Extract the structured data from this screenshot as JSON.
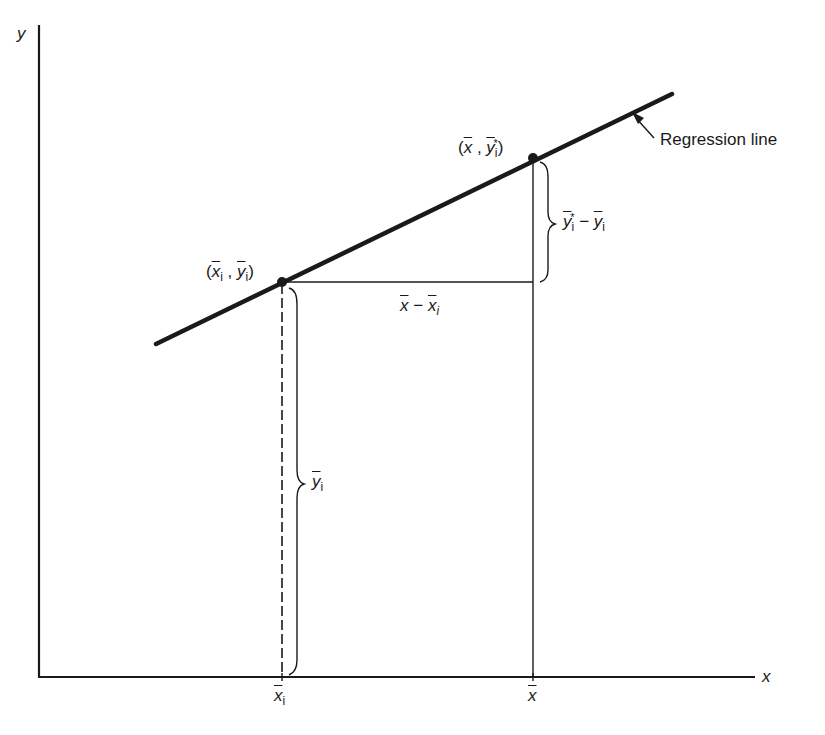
{
  "diagram": {
    "title": "",
    "axes": {
      "x_label": "x",
      "y_label": "y"
    },
    "regression_line_label": "Regression line",
    "points": [
      {
        "id": "point-i",
        "label_open": "(",
        "x_sym": "x",
        "x_sub": "i",
        "sep": " , ",
        "y_sym": "y",
        "y_sub": "i",
        "label_close": ")"
      },
      {
        "id": "point-mean",
        "label_open": "(",
        "x_sym": "x",
        "sep": " , ",
        "y_sym": "y",
        "y_sup": "*",
        "y_sub": "i",
        "label_close": ")"
      }
    ],
    "annotations": {
      "vertical_diff": {
        "a_sym": "y",
        "a_sup": "*",
        "a_sub": "i",
        "minus": " − ",
        "b_sym": "y",
        "b_sub": "i"
      },
      "horizontal_diff": {
        "a_sym": "x",
        "minus": " − ",
        "b_sym": "x",
        "b_sub": "i"
      },
      "height_brace": {
        "sym": "y",
        "sub": "i"
      }
    },
    "x_ticks": [
      {
        "sym": "x",
        "sub": "i"
      },
      {
        "sym": "x",
        "sub": ""
      }
    ],
    "colors": {
      "line": "#1a1a1a",
      "background": "#ffffff"
    }
  }
}
